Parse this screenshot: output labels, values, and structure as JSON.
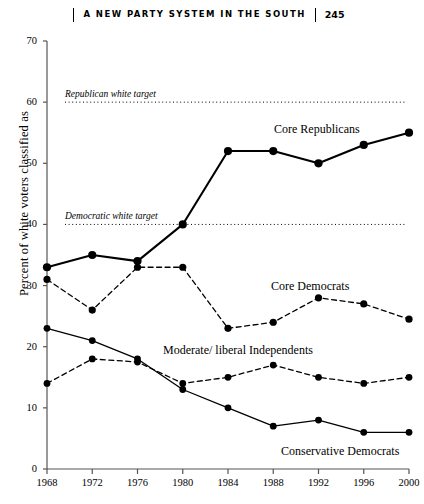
{
  "running_head": {
    "title": "A NEW PARTY SYSTEM IN THE SOUTH",
    "page_number": "245"
  },
  "chart_data": {
    "type": "line",
    "title": "",
    "xlabel": "",
    "ylabel": "Percent of white voters classified as",
    "x": [
      1968,
      1972,
      1976,
      1980,
      1984,
      1988,
      1992,
      1996,
      2000
    ],
    "xtick_labels": [
      "1968",
      "1972",
      "1976",
      "1980",
      "1984",
      "1988",
      "1992",
      "1996",
      "2000"
    ],
    "ytick_labels": [
      "0",
      "10",
      "20",
      "30",
      "40",
      "50",
      "60",
      "70"
    ],
    "yticks": [
      0,
      10,
      20,
      30,
      40,
      50,
      60,
      70
    ],
    "ylim": [
      0,
      70
    ],
    "xlim": [
      1968,
      2000
    ],
    "grid": false,
    "legend_position": "inline-labels",
    "series": [
      {
        "name": "Core Republicans",
        "style": "solid",
        "values": [
          33,
          35,
          34,
          40,
          52,
          52,
          50,
          53,
          55
        ]
      },
      {
        "name": "Core Democrats",
        "style": "dashed",
        "values": [
          31,
          26,
          33,
          33,
          23,
          24,
          28,
          27,
          24.5
        ]
      },
      {
        "name": "Conservative Democrats",
        "style": "solid",
        "values": [
          23,
          21,
          18,
          13,
          10,
          7,
          8,
          6,
          6
        ]
      },
      {
        "name": "Moderate/ liberal Independents",
        "style": "dashed",
        "values": [
          14,
          18,
          17.5,
          14,
          15,
          17,
          15,
          14,
          15
        ]
      }
    ],
    "reference_lines": [
      {
        "label": "Republican white target",
        "value": 60,
        "style": "dotted"
      },
      {
        "label": "Democratic white target",
        "value": 40,
        "style": "dotted"
      }
    ]
  }
}
